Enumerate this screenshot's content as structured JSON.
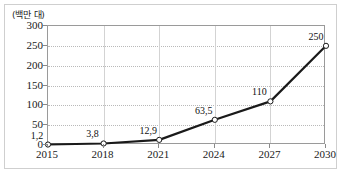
{
  "chart_data": {
    "type": "line",
    "title": "",
    "subtitle": "",
    "xlabel": "",
    "ylabel": "",
    "unit_label": "(백만 대)",
    "categories": [
      "2015",
      "2018",
      "2021",
      "2024",
      "2027",
      "2030"
    ],
    "x": [
      2015,
      2018,
      2021,
      2024,
      2027,
      2030
    ],
    "values": [
      1.2,
      3.8,
      12.9,
      63.5,
      110,
      250
    ],
    "point_labels": [
      "1,2",
      "3,8",
      "12,9",
      "63,5",
      "110",
      "250"
    ],
    "ylim": [
      0,
      300
    ],
    "yticks": [
      0,
      50,
      100,
      150,
      200,
      250,
      300
    ],
    "ytick_labels": [
      "0",
      "50",
      "100",
      "150",
      "200",
      "250",
      "300"
    ],
    "xlim": [
      2015,
      2030
    ],
    "grid": "horizontal-dotted-and-vertical-solid",
    "legend": "none",
    "legend_position": "none",
    "series": [
      {
        "name": "",
        "values": [
          1.2,
          3.8,
          12.9,
          63.5,
          110,
          250
        ]
      }
    ],
    "marker": "open-circle",
    "colors": {
      "line": "#1a1a1a",
      "marker_fill": "#ffffff",
      "marker_stroke": "#1a1a1a",
      "grid_horizontal": "#b9b9b9",
      "grid_vertical": "#d3d3d3",
      "plot_border": "#9a9a9a",
      "outer_border": "#cfcfcf",
      "text": "#1a1a1a",
      "background": "#ffffff"
    }
  }
}
